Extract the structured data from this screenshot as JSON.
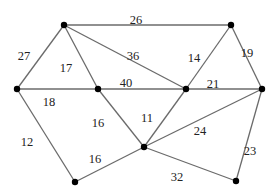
{
  "diagram": {
    "type": "weighted-undirected-graph",
    "colors": {
      "edge": "#6b6b6b",
      "node": "#000000",
      "label": "#222222",
      "background": "#ffffff"
    },
    "nodes": [
      {
        "id": "A",
        "x": 64,
        "y": 25
      },
      {
        "id": "B",
        "x": 231,
        "y": 25
      },
      {
        "id": "C",
        "x": 17,
        "y": 89
      },
      {
        "id": "D",
        "x": 98,
        "y": 89
      },
      {
        "id": "E",
        "x": 186,
        "y": 89
      },
      {
        "id": "F",
        "x": 262,
        "y": 89
      },
      {
        "id": "G",
        "x": 144,
        "y": 147
      },
      {
        "id": "H",
        "x": 75,
        "y": 182
      },
      {
        "id": "I",
        "x": 236,
        "y": 181
      }
    ],
    "edges": [
      {
        "from": "A",
        "to": "B",
        "weight": "26",
        "lx": 136,
        "ly": 21
      },
      {
        "from": "A",
        "to": "C",
        "weight": "27",
        "lx": 24,
        "ly": 57
      },
      {
        "from": "A",
        "to": "D",
        "weight": "17",
        "lx": 66,
        "ly": 69
      },
      {
        "from": "A",
        "to": "E",
        "weight": "36",
        "lx": 133,
        "ly": 57
      },
      {
        "from": "C",
        "to": "D",
        "weight": "18",
        "lx": 49,
        "ly": 103
      },
      {
        "from": "D",
        "to": "E",
        "weight": "40",
        "lx": 126,
        "ly": 84
      },
      {
        "from": "B",
        "to": "E",
        "weight": "14",
        "lx": 194,
        "ly": 59
      },
      {
        "from": "B",
        "to": "F",
        "weight": "19",
        "lx": 247,
        "ly": 54
      },
      {
        "from": "E",
        "to": "F",
        "weight": "21",
        "lx": 213,
        "ly": 85
      },
      {
        "from": "C",
        "to": "H",
        "weight": "12",
        "lx": 27,
        "ly": 143
      },
      {
        "from": "D",
        "to": "G",
        "weight": "16",
        "lx": 98,
        "ly": 124
      },
      {
        "from": "E",
        "to": "G",
        "weight": "11",
        "lx": 147,
        "ly": 119
      },
      {
        "from": "G",
        "to": "F",
        "weight": "24",
        "lx": 200,
        "ly": 132
      },
      {
        "from": "H",
        "to": "G",
        "weight": "16",
        "lx": 95,
        "ly": 160
      },
      {
        "from": "G",
        "to": "I",
        "weight": "32",
        "lx": 177,
        "ly": 178
      },
      {
        "from": "F",
        "to": "I",
        "weight": "23",
        "lx": 250,
        "ly": 152
      }
    ]
  }
}
